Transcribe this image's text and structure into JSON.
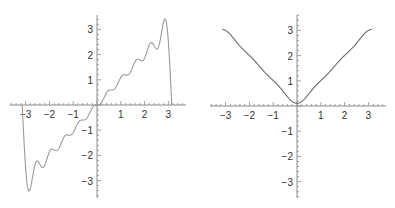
{
  "chart_data": [
    {
      "type": "line",
      "title": "",
      "description": "Fourier partial sum of sawtooth f(x)=x on [-pi, pi] showing Gibbs overshoot",
      "formula": "2*sum_{n=1}^{10} (-1)^(n+1) sin(n x)/n",
      "terms": 10,
      "xlabel": "",
      "ylabel": "",
      "xlim": [
        -3.6,
        3.6
      ],
      "ylim": [
        -3.6,
        3.6
      ],
      "x_ticks": [
        -3,
        -2,
        -1,
        1,
        2,
        3
      ],
      "y_ticks": [
        -3,
        -2,
        -1,
        1,
        2,
        3
      ],
      "x_tick_labels": [
        "−3",
        "−2",
        "−1",
        "1",
        "2",
        "3"
      ],
      "y_tick_labels": [
        "−3",
        "−2",
        "−1",
        "1",
        "2",
        "3"
      ],
      "domain": [
        -3.14159,
        3.14159
      ],
      "key_points": [
        {
          "x": -3.14,
          "y": 0
        },
        {
          "x": -2.95,
          "y": -3.4
        },
        {
          "x": -2.6,
          "y": -2.2
        },
        {
          "x": -2.3,
          "y": -2.45
        },
        {
          "x": 0,
          "y": 0
        },
        {
          "x": 2.3,
          "y": 2.45
        },
        {
          "x": 2.6,
          "y": 2.2
        },
        {
          "x": 2.95,
          "y": 3.4
        },
        {
          "x": 3.14,
          "y": 0
        }
      ],
      "grid": false,
      "legend": null,
      "line_color": "#9a9a9a"
    },
    {
      "type": "line",
      "title": "",
      "description": "Fourier partial sum of |x| on [-pi, pi]",
      "formula": "pi/2 - (4/pi)*sum_{k=1}^{3} cos((2k-1) x)/(2k-1)^2",
      "terms": 3,
      "xlabel": "",
      "ylabel": "",
      "xlim": [
        -3.6,
        3.6
      ],
      "ylim": [
        -3.6,
        3.6
      ],
      "x_ticks": [
        -3,
        -2,
        -1,
        1,
        2,
        3
      ],
      "y_ticks": [
        -3,
        -2,
        -1,
        1,
        2,
        3
      ],
      "x_tick_labels": [
        "−3",
        "−2",
        "−1",
        "1",
        "2",
        "3"
      ],
      "y_tick_labels": [
        "−3",
        "−2",
        "−1",
        "1",
        "2",
        "3"
      ],
      "domain": [
        -3.14159,
        3.14159
      ],
      "key_points": [
        {
          "x": -3.14,
          "y": 3.05
        },
        {
          "x": -2,
          "y": 2.0
        },
        {
          "x": -1,
          "y": 0.95
        },
        {
          "x": 0,
          "y": 0.09
        },
        {
          "x": 1,
          "y": 0.95
        },
        {
          "x": 2,
          "y": 2.0
        },
        {
          "x": 3.14,
          "y": 3.05
        }
      ],
      "grid": false,
      "legend": null,
      "line_color": "#6a6a6a"
    }
  ],
  "style": {
    "axis_color": "#8a8a8a",
    "label_color": "#333333"
  }
}
